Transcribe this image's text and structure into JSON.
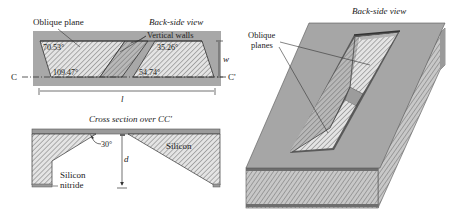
{
  "top_view": {
    "title": "Back-side view",
    "oblique_label": "Oblique plane",
    "vertical_walls_label": "Vertical walls",
    "angle_top_left": "70.53°",
    "angle_bottom_left": "109.47°",
    "angle_top_right": "35.26°",
    "angle_bottom_right": "54.74°",
    "width_label": "w",
    "length_label": "l",
    "section_start": "C",
    "section_end": "C'"
  },
  "cross_section": {
    "title": "Cross section over CC'",
    "angle_label": "30°",
    "depth_label": "d",
    "silicon_label": "Silicon",
    "nitride_label_line1": "Silicon",
    "nitride_label_line2": "nitride"
  },
  "iso_view": {
    "title": "Back-side view",
    "oblique_label_line1": "Oblique",
    "oblique_label_line2": "planes"
  },
  "colors": {
    "surface_gray": "#a6a6a6",
    "hatch_fill": "#e2e2e2",
    "hatch_line": "#6a6a6a",
    "edge_dark": "#4a4a4a",
    "text": "#222222"
  }
}
